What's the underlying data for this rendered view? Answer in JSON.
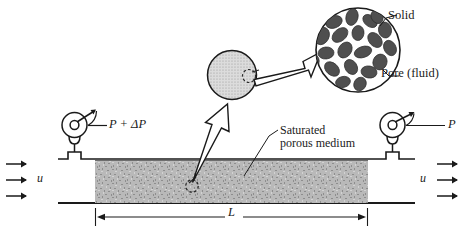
{
  "figure": {
    "type": "schematic-diagram"
  },
  "labels": {
    "solid": "Solid",
    "pore": "Pore (fluid)",
    "saturated_line1": "Saturated",
    "saturated_line2": "porous medium",
    "pressure_inlet": "P + ΔP",
    "pressure_outlet": "P",
    "velocity_inlet": "u",
    "velocity_outlet": "u",
    "length": "L"
  },
  "icons": {
    "gauge_inlet": "pressure-gauge-icon",
    "gauge_outlet": "pressure-gauge-icon",
    "flow_arrow": "right-arrow-icon",
    "magnify_arrow": "block-arrow-icon",
    "dimension_arrow": "double-headed-arrow-icon"
  },
  "colors": {
    "stroke": "#1a1a1a",
    "medium_fill": "#b4b4b4",
    "grain_fill": "#4a4a4a",
    "stipple_fill": "#c8c8c8",
    "background": "#ffffff"
  },
  "geometry": {
    "medium_x": 95,
    "medium_width": 273,
    "pipe_top_y": 159,
    "pipe_bottom_y": 203,
    "length_dim_y": 217
  }
}
